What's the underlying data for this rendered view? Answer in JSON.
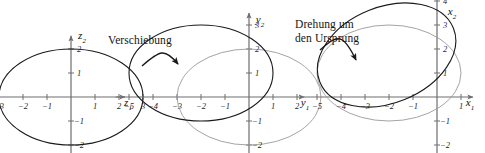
{
  "figure": {
    "kind": "math-diagram",
    "width": 485,
    "height": 153,
    "background": "#ffffff",
    "curve_color": "#1a1a1a",
    "ghost_curve_color": "#9a9a9a",
    "axis_color": "#6e6e6e",
    "unit_px": 24
  },
  "annotations": [
    {
      "id": "shift",
      "label": "Verschiebung",
      "x": 108,
      "y": 34
    },
    {
      "id": "rotate",
      "label": "Drehung um",
      "x": 295,
      "y": 18
    },
    {
      "id": "rotate2",
      "label": "den Ursprung",
      "x": 295,
      "y": 32
    }
  ],
  "panels": [
    {
      "id": "panel-z",
      "origin": {
        "x": 71,
        "y": 97
      },
      "xaxis": {
        "label": "z",
        "sub": "1",
        "label_x": 128,
        "label_y": 104,
        "from": -3.55,
        "to": 2.25,
        "ticks": [
          {
            "v": -3,
            "text": "−3"
          },
          {
            "v": -2,
            "text": "−2"
          },
          {
            "v": -1,
            "text": "−1"
          },
          {
            "v": 1,
            "text": "1"
          },
          {
            "v": 2,
            "text": "2"
          },
          {
            "v": 3,
            "text": "3"
          }
        ]
      },
      "yaxis": {
        "label": "z",
        "sub": "2",
        "label_x": 82,
        "label_y": 37,
        "from": -2.45,
        "to": 2.55,
        "ticks": [
          {
            "v": 2,
            "text": "2"
          },
          {
            "v": 1,
            "text": "1"
          },
          {
            "v": -1,
            "text": "−1"
          },
          {
            "v": -2,
            "text": "−2"
          }
        ]
      },
      "curves": [
        {
          "id": "ellipse-z",
          "tone": "dark",
          "cx": 0,
          "cy": 0,
          "a": 3,
          "b": 2,
          "rot_deg": 0
        }
      ]
    },
    {
      "id": "panel-y",
      "origin": {
        "x": 249,
        "y": 97
      },
      "xaxis": {
        "label": "y",
        "sub": "1",
        "label_x": 305,
        "label_y": 104,
        "from": -5.55,
        "to": 2.3,
        "ticks": [
          {
            "v": -5,
            "text": "−5"
          },
          {
            "v": -4,
            "text": "−4"
          },
          {
            "v": -3,
            "text": "−3"
          },
          {
            "v": -2,
            "text": "−2"
          },
          {
            "v": -1,
            "text": "−1"
          },
          {
            "v": 1,
            "text": "1"
          },
          {
            "v": 2,
            "text": "2"
          }
        ]
      },
      "yaxis": {
        "label": "y",
        "sub": "2",
        "label_x": 260,
        "label_y": 21,
        "from": -2.45,
        "to": 3.5,
        "ticks": [
          {
            "v": 3,
            "text": "3"
          },
          {
            "v": 2,
            "text": "2"
          },
          {
            "v": 1,
            "text": "1"
          },
          {
            "v": -1,
            "text": "−1"
          },
          {
            "v": -2,
            "text": "−2"
          }
        ]
      },
      "curves": [
        {
          "id": "ellipse-y-orig",
          "tone": "ghost",
          "cx": 0,
          "cy": 0,
          "a": 3,
          "b": 2,
          "rot_deg": 0
        },
        {
          "id": "ellipse-y-shifted",
          "tone": "dark",
          "cx": -2,
          "cy": 1,
          "a": 3,
          "b": 2,
          "rot_deg": 0
        }
      ]
    },
    {
      "id": "panel-x",
      "origin": {
        "x": 437,
        "y": 97
      },
      "xaxis": {
        "label": "x",
        "sub": "1",
        "label_x": 470,
        "label_y": 104,
        "from": -5.55,
        "to": 1.5,
        "ticks": [
          {
            "v": -5,
            "text": "−5"
          },
          {
            "v": -4,
            "text": "−4"
          },
          {
            "v": -3,
            "text": "−3"
          },
          {
            "v": -2,
            "text": "−2"
          },
          {
            "v": -1,
            "text": "−1"
          },
          {
            "v": 1,
            "text": "1"
          }
        ]
      },
      "yaxis": {
        "label": "x",
        "sub": "2",
        "label_x": 452,
        "label_y": 13,
        "from": -2.45,
        "to": 4.6,
        "ticks": [
          {
            "v": 4,
            "text": "4"
          },
          {
            "v": 3,
            "text": "3"
          },
          {
            "v": 2,
            "text": "2"
          },
          {
            "v": 1,
            "text": "1"
          },
          {
            "v": -1,
            "text": "−1"
          },
          {
            "v": -2,
            "text": "−2"
          }
        ]
      },
      "curves": [
        {
          "id": "ellipse-x-shifted",
          "tone": "ghost",
          "cx": -2,
          "cy": 1,
          "a": 3,
          "b": 2,
          "rot_deg": 0
        },
        {
          "id": "ellipse-x-rotated",
          "tone": "dark",
          "cx": -2.1,
          "cy": 1.75,
          "a": 3,
          "b": 2,
          "rot_deg": -22
        }
      ]
    }
  ],
  "arrows": [
    {
      "id": "arrow-shift",
      "from_x": 142,
      "from_y": 66,
      "c1x": 160,
      "c1y": 50,
      "c2x": 165,
      "c2y": 48,
      "to_x": 178,
      "to_y": 64
    },
    {
      "id": "arrow-rotate",
      "from_x": 320,
      "from_y": 50,
      "c1x": 338,
      "c1y": 34,
      "c2x": 343,
      "c2y": 33,
      "to_x": 356,
      "to_y": 60
    }
  ]
}
